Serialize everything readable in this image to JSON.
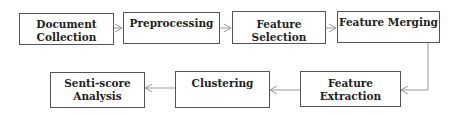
{
  "diagram": {
    "type": "flowchart",
    "nodes": [
      {
        "id": "doc",
        "label_line1": "Document",
        "label_line2": "Collection"
      },
      {
        "id": "pre",
        "label_line1": "Preprocessing",
        "label_line2": ""
      },
      {
        "id": "sel",
        "label_line1": "Feature Selection",
        "label_line2": ""
      },
      {
        "id": "mer",
        "label_line1": "Feature Merging",
        "label_line2": ""
      },
      {
        "id": "ext",
        "label_line1": "Feature Extraction",
        "label_line2": ""
      },
      {
        "id": "clu",
        "label_line1": "Clustering",
        "label_line2": ""
      },
      {
        "id": "sen",
        "label_line1": "Senti-score",
        "label_line2": "Analysis"
      }
    ],
    "edges": [
      [
        "doc",
        "pre"
      ],
      [
        "pre",
        "sel"
      ],
      [
        "sel",
        "mer"
      ],
      [
        "mer",
        "ext"
      ],
      [
        "ext",
        "clu"
      ],
      [
        "clu",
        "sen"
      ]
    ],
    "colors": {
      "border": "#555555",
      "arrow": "#999999",
      "text": "#222222"
    }
  }
}
